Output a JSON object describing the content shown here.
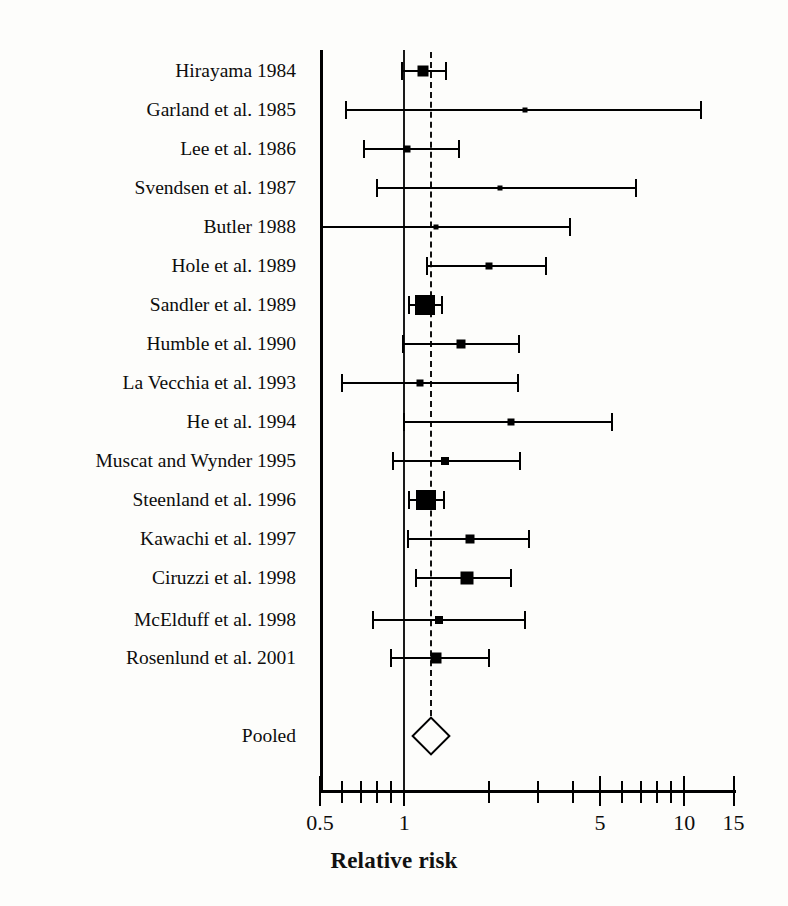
{
  "chart_data": {
    "type": "forest",
    "title": "",
    "xlabel": "Relative risk",
    "ylabel": "",
    "scale": "log",
    "xlim": [
      0.5,
      15
    ],
    "axis_pixels": {
      "x_at_min": 320,
      "px_per_decade": 280,
      "top": 50,
      "bottom": 790
    },
    "tick_values": [
      0.5,
      0.6,
      0.7,
      0.8,
      0.9,
      1,
      2,
      3,
      4,
      5,
      6,
      7,
      8,
      9,
      10,
      15
    ],
    "tick_labels": [
      {
        "value": 0.5,
        "label": "0.5"
      },
      {
        "value": 1,
        "label": "1"
      },
      {
        "value": 5,
        "label": "5"
      },
      {
        "value": 10,
        "label": "10"
      },
      {
        "value": 15,
        "label": "15"
      }
    ],
    "reference_line": 1,
    "pooled_line": 1.25,
    "grid": false,
    "legend": "none",
    "categories": [
      "Hirayama 1984",
      "Garland et al. 1985",
      "Lee et al. 1986",
      "Svendsen et al. 1987",
      "Butler 1988",
      "Hole et al. 1989",
      "Sandler et al. 1989",
      "Humble et al. 1990",
      "La Vecchia et al. 1993",
      "He et al. 1994",
      "Muscat and Wynder 1995",
      "Steenland et al. 1996",
      "Kawachi et al. 1997",
      "Ciruzzi et al. 1998",
      "McElduff et al. 1998",
      "Rosenlund et al. 2001",
      "Pooled"
    ],
    "studies": [
      {
        "label": "Hirayama 1984",
        "rr": 1.17,
        "low": 0.98,
        "high": 1.41,
        "box": 11,
        "y": 71
      },
      {
        "label": "Garland et al. 1985",
        "rr": 2.7,
        "low": 0.62,
        "high": 11.5,
        "box": 5,
        "y": 110
      },
      {
        "label": "Lee et al. 1986",
        "rr": 1.02,
        "low": 0.72,
        "high": 1.57,
        "box": 7,
        "y": 149
      },
      {
        "label": "Svendsen et al. 1987",
        "rr": 2.2,
        "low": 0.8,
        "high": 6.7,
        "box": 5,
        "y": 188
      },
      {
        "label": "Butler 1988",
        "rr": 1.3,
        "low": 0.5,
        "high": 3.9,
        "box": 5,
        "y": 227
      },
      {
        "label": "Hole et al. 1989",
        "rr": 2.01,
        "low": 1.21,
        "high": 3.2,
        "box": 7,
        "y": 266
      },
      {
        "label": "Sandler et al. 1989",
        "rr": 1.19,
        "low": 1.04,
        "high": 1.36,
        "box": 20,
        "y": 305
      },
      {
        "label": "Humble et al. 1990",
        "rr": 1.59,
        "low": 0.99,
        "high": 2.57,
        "box": 9,
        "y": 344
      },
      {
        "label": "La Vecchia et al. 1993",
        "rr": 1.14,
        "low": 0.6,
        "high": 2.55,
        "box": 7,
        "y": 383
      },
      {
        "label": "He et al. 1994",
        "rr": 2.4,
        "low": 1.0,
        "high": 5.5,
        "box": 7,
        "y": 422
      },
      {
        "label": "Muscat and Wynder 1995",
        "rr": 1.4,
        "low": 0.91,
        "high": 2.6,
        "box": 8,
        "y": 461
      },
      {
        "label": "Steenland et al. 1996",
        "rr": 1.2,
        "low": 1.04,
        "high": 1.39,
        "box": 20,
        "y": 500
      },
      {
        "label": "Kawachi et al. 1997",
        "rr": 1.71,
        "low": 1.03,
        "high": 2.8,
        "box": 9,
        "y": 539
      },
      {
        "label": "Ciruzzi et al. 1998",
        "rr": 1.68,
        "low": 1.1,
        "high": 2.4,
        "box": 13,
        "y": 578
      },
      {
        "label": "McElduff et al. 1998",
        "rr": 1.33,
        "low": 0.77,
        "high": 2.7,
        "box": 8,
        "y": 620
      },
      {
        "label": "Rosenlund et al. 2001",
        "rr": 1.3,
        "low": 0.9,
        "high": 2.0,
        "box": 11,
        "y": 658
      }
    ],
    "pooled": {
      "label": "Pooled",
      "rr": 1.25,
      "low": 1.17,
      "high": 1.32,
      "y": 736,
      "w": 30,
      "h": 30
    }
  }
}
